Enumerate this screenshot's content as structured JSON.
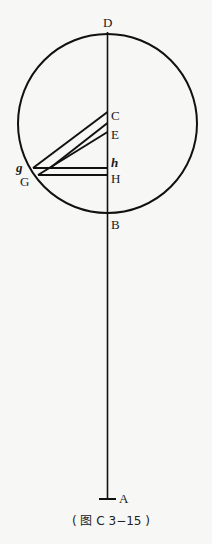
{
  "figure": {
    "caption": "( 图 C 3−15 )",
    "stroke_color": "#111111",
    "background": "#f7f7f5"
  },
  "labels": {
    "D": "D",
    "C": "C",
    "E": "E",
    "h": "h",
    "H": "H",
    "B": "B",
    "A": "A",
    "g": "g",
    "G": "G"
  }
}
